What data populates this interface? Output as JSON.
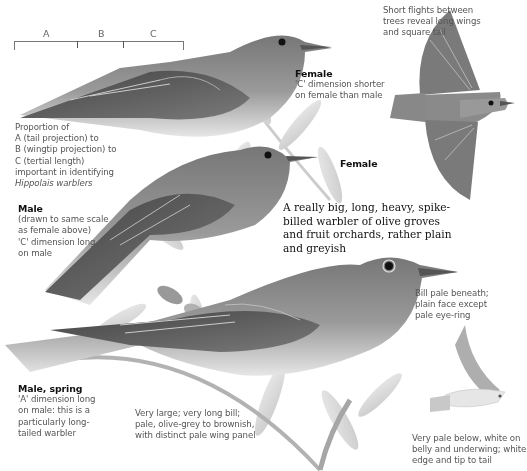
{
  "plate": {
    "species_group": "Hippolais warblers",
    "background": "#ffffff"
  },
  "scale": {
    "labels": [
      "A",
      "B",
      "C"
    ]
  },
  "notes": {
    "female_perched": {
      "title": "Female",
      "text": "'C' dimension shorter on female than male"
    },
    "flight": {
      "text_lines": [
        "Short flights between",
        "trees reveal long wings",
        "and square tail"
      ]
    },
    "flight_label": {
      "title": "Female"
    },
    "proportion": {
      "text_lines": [
        "Proportion of",
        "A (tail projection) to",
        "B (wingtip projection) to",
        "C (tertial length)",
        "important in identifying",
        "Hippolais warblers"
      ]
    },
    "male": {
      "title": "Male",
      "text_lines": [
        "(drawn to same scale",
        "as female above)",
        "'C' dimension long",
        "on male"
      ]
    },
    "lead": {
      "text_lines": [
        "A really big, long, heavy, spike-",
        "billed warbler of olive groves",
        "and fruit orchards, rather plain",
        "and greyish"
      ]
    },
    "bill": {
      "text_lines": [
        "Bill pale beneath;",
        "plain face except",
        "pale eye-ring"
      ]
    },
    "male_spring": {
      "title": "Male, spring",
      "text_lines": [
        "'A' dimension long",
        "on male: this is a",
        "particularly long-",
        "tailed warbler"
      ]
    },
    "size": {
      "text_lines": [
        "Very large; very long bill;",
        "pale, olive-grey to brownish,",
        "with distinct pale wing panel"
      ]
    },
    "underside": {
      "text_lines": [
        "Very pale below, white on",
        "belly and underwing; white",
        "edge and tip to tail"
      ]
    }
  },
  "colors": {
    "ink": "#111111",
    "annotation": "#555555",
    "bird_dark": "#4d4d4d",
    "bird_mid": "#8a8a8a",
    "bird_light": "#d9d9d9",
    "foliage": "#c8c8c8"
  }
}
